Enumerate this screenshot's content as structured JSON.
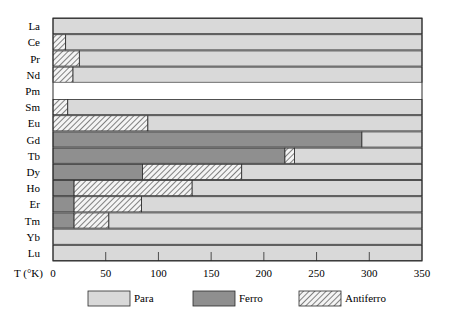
{
  "chart_data": {
    "type": "bar",
    "orientation": "horizontal-stacked",
    "title": "",
    "xlabel": "T (°K)",
    "ylabel": "",
    "xlim": [
      0,
      350
    ],
    "xticks": [
      0,
      50,
      100,
      150,
      200,
      250,
      300,
      350
    ],
    "grid": false,
    "legend_position": "bottom",
    "categories": [
      "La",
      "Ce",
      "Pr",
      "Nd",
      "Pm",
      "Sm",
      "Eu",
      "Gd",
      "Tb",
      "Dy",
      "Ho",
      "Er",
      "Tm",
      "Yb",
      "Lu"
    ],
    "series": [
      {
        "name": "Para",
        "color": "#d9d9d9"
      },
      {
        "name": "Ferro",
        "color": "#8f8f8f"
      },
      {
        "name": "Antiferro",
        "color": "hatched"
      }
    ],
    "rows": [
      {
        "element": "La",
        "segments": [
          {
            "phase": "Para",
            "from": 0,
            "to": 350
          }
        ]
      },
      {
        "element": "Ce",
        "segments": [
          {
            "phase": "Antiferro",
            "from": 0,
            "to": 12
          },
          {
            "phase": "Para",
            "from": 12,
            "to": 350
          }
        ]
      },
      {
        "element": "Pr",
        "segments": [
          {
            "phase": "Antiferro",
            "from": 0,
            "to": 25
          },
          {
            "phase": "Para",
            "from": 25,
            "to": 350
          }
        ]
      },
      {
        "element": "Nd",
        "segments": [
          {
            "phase": "Antiferro",
            "from": 0,
            "to": 19
          },
          {
            "phase": "Para",
            "from": 19,
            "to": 350
          }
        ]
      },
      {
        "element": "Pm",
        "segments": []
      },
      {
        "element": "Sm",
        "segments": [
          {
            "phase": "Antiferro",
            "from": 0,
            "to": 14
          },
          {
            "phase": "Para",
            "from": 14,
            "to": 350
          }
        ]
      },
      {
        "element": "Eu",
        "segments": [
          {
            "phase": "Antiferro",
            "from": 0,
            "to": 90
          },
          {
            "phase": "Para",
            "from": 90,
            "to": 350
          }
        ]
      },
      {
        "element": "Gd",
        "segments": [
          {
            "phase": "Ferro",
            "from": 0,
            "to": 293
          },
          {
            "phase": "Para",
            "from": 293,
            "to": 350
          }
        ]
      },
      {
        "element": "Tb",
        "segments": [
          {
            "phase": "Ferro",
            "from": 0,
            "to": 220
          },
          {
            "phase": "Antiferro",
            "from": 220,
            "to": 229
          },
          {
            "phase": "Para",
            "from": 229,
            "to": 350
          }
        ]
      },
      {
        "element": "Dy",
        "segments": [
          {
            "phase": "Ferro",
            "from": 0,
            "to": 85
          },
          {
            "phase": "Antiferro",
            "from": 85,
            "to": 179
          },
          {
            "phase": "Para",
            "from": 179,
            "to": 350
          }
        ]
      },
      {
        "element": "Ho",
        "segments": [
          {
            "phase": "Ferro",
            "from": 0,
            "to": 20
          },
          {
            "phase": "Antiferro",
            "from": 20,
            "to": 132
          },
          {
            "phase": "Para",
            "from": 132,
            "to": 350
          }
        ]
      },
      {
        "element": "Er",
        "segments": [
          {
            "phase": "Ferro",
            "from": 0,
            "to": 20
          },
          {
            "phase": "Antiferro",
            "from": 20,
            "to": 84
          },
          {
            "phase": "Para",
            "from": 84,
            "to": 350
          }
        ]
      },
      {
        "element": "Tm",
        "segments": [
          {
            "phase": "Ferro",
            "from": 0,
            "to": 20
          },
          {
            "phase": "Antiferro",
            "from": 20,
            "to": 53
          },
          {
            "phase": "Para",
            "from": 53,
            "to": 350
          }
        ]
      },
      {
        "element": "Yb",
        "segments": [
          {
            "phase": "Para",
            "from": 0,
            "to": 350
          }
        ]
      },
      {
        "element": "Lu",
        "segments": [
          {
            "phase": "Para",
            "from": 0,
            "to": 350
          }
        ]
      }
    ]
  },
  "axis": {
    "xlabel": "T (°K)",
    "tick_labels": [
      "0",
      "50",
      "100",
      "150",
      "200",
      "250",
      "300",
      "350"
    ]
  },
  "legend": {
    "items": [
      {
        "label": "Para",
        "phase": "Para"
      },
      {
        "label": "Ferro",
        "phase": "Ferro"
      },
      {
        "label": "Antiferro",
        "phase": "Antiferro"
      }
    ]
  },
  "colors": {
    "para": "#d9d9d9",
    "ferro": "#8f8f8f",
    "hatch_bg": "#f4f4f4",
    "hatch_line": "#333333",
    "outline": "#2a2a2a"
  }
}
